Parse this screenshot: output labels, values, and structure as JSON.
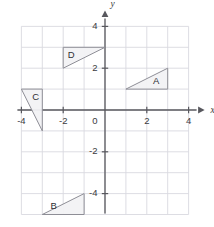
{
  "figure": {
    "type": "coordinate-plane",
    "background_color": "#ffffff",
    "grid_color": "#d9d9e0",
    "axis_color": "#58585e",
    "shape_fill": "#f2f2f4",
    "shape_stroke": "#8e8e96"
  },
  "chart_data": {
    "type": "scatter",
    "title": "",
    "xlabel": "x",
    "ylabel": "y",
    "xlim": [
      -4,
      4
    ],
    "ylim": [
      -5,
      4
    ],
    "grid": true,
    "legend": "none",
    "x_ticks": [
      -4,
      -2,
      2,
      4
    ],
    "x_tick_labels": [
      "-4",
      "-2",
      "2",
      "4"
    ],
    "y_ticks": [
      -4,
      -2,
      2,
      4
    ],
    "y_tick_labels": [
      "-4",
      "-2",
      "2",
      "4"
    ],
    "origin_label": "0",
    "grid_step": 1,
    "shapes": [
      {
        "name": "A",
        "label": "A",
        "vertices": [
          [
            1,
            1
          ],
          [
            3,
            1
          ],
          [
            3,
            2
          ]
        ],
        "label_position": [
          2.45,
          1.35
        ]
      },
      {
        "name": "B",
        "label": "B",
        "vertices": [
          [
            -3,
            -5
          ],
          [
            -1,
            -5
          ],
          [
            -1,
            -4
          ]
        ],
        "label_position": [
          -2.45,
          -4.62
        ]
      },
      {
        "name": "C",
        "label": "C",
        "vertices": [
          [
            -4,
            1
          ],
          [
            -3,
            1
          ],
          [
            -3,
            -1
          ]
        ],
        "label_position": [
          -3.32,
          0.6
        ]
      },
      {
        "name": "D",
        "label": "D",
        "vertices": [
          [
            -2,
            3
          ],
          [
            0,
            3
          ],
          [
            -2,
            2
          ]
        ],
        "label_position": [
          -1.62,
          2.62
        ]
      }
    ]
  },
  "axes": {
    "x_axis_name": "x",
    "y_axis_name": "y"
  }
}
